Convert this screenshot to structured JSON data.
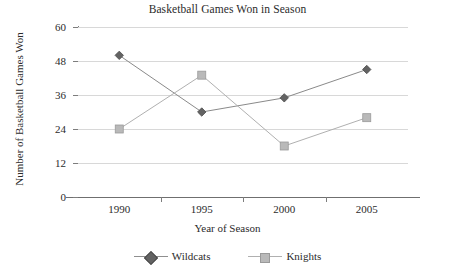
{
  "chart_data": {
    "type": "line",
    "title": "Basketball Games Won in Season",
    "xlabel": "Year of Season",
    "ylabel": "Number of Basketball Games Won",
    "categories": [
      "1990",
      "1995",
      "2000",
      "2005"
    ],
    "x": [
      1990,
      1995,
      2000,
      2005
    ],
    "series": [
      {
        "name": "Wildcats",
        "values": [
          50,
          30,
          35,
          45
        ],
        "color": "#636363",
        "marker": "diamond"
      },
      {
        "name": "Knights",
        "values": [
          24,
          43,
          18,
          28
        ],
        "color": "#b9b9b9",
        "marker": "square"
      }
    ],
    "yticks": [
      0,
      12,
      24,
      36,
      48,
      60
    ],
    "ylim": [
      0,
      60
    ],
    "grid": true,
    "legend_position": "bottom"
  },
  "legend": {
    "items": [
      {
        "label": "Wildcats"
      },
      {
        "label": "Knights"
      }
    ]
  },
  "colors": {
    "wildcats": "#636363",
    "knights": "#b9b9b9",
    "gridline": "#d8d8d8",
    "axis": "#7d7d7d",
    "text": "#2b2b2b",
    "background": "#ffffff"
  }
}
